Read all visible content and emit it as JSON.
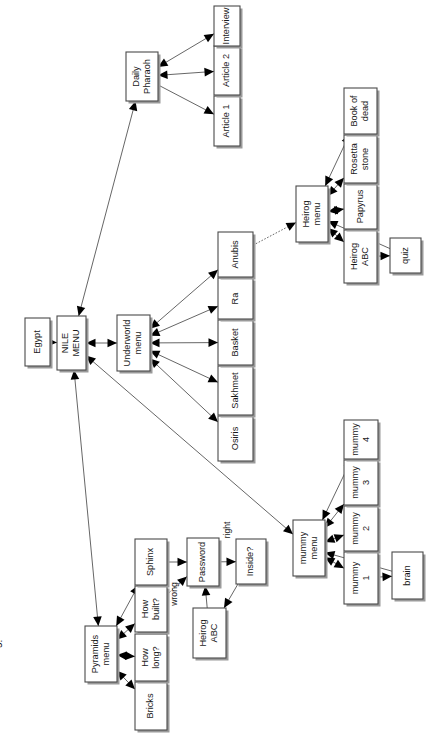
{
  "diagram": {
    "orientation": "rotated-90-counterclockwise",
    "root_label": "Egypt",
    "caption_fragment": "5.",
    "colors": {
      "box_stroke": "#4a4a4a",
      "box_fill": "#ffffff",
      "shadow": "#9a9a9a",
      "edge": "#4a4a4a",
      "arrow": "#000000",
      "text": "#1a1a1a",
      "background": "#ffffff"
    },
    "nodes": [
      {
        "id": "egypt",
        "label": "Egypt",
        "lines": [
          "Egypt"
        ]
      },
      {
        "id": "nile-menu",
        "label": "NILE MENU",
        "lines": [
          "NILE",
          "MENU"
        ]
      },
      {
        "id": "daily-pharaoh",
        "label": "Daily Pharaoh",
        "lines": [
          "Daily",
          "Pharaoh"
        ]
      },
      {
        "id": "article-1",
        "label": "Article 1",
        "lines": [
          "Article 1"
        ]
      },
      {
        "id": "article-2",
        "label": "Article 2",
        "lines": [
          "Article 2"
        ]
      },
      {
        "id": "interview",
        "label": "Interview",
        "lines": [
          "Interview"
        ]
      },
      {
        "id": "underworld-menu",
        "label": "Underworld menu",
        "lines": [
          "Underworld",
          "menu"
        ]
      },
      {
        "id": "osiris",
        "label": "Osiris",
        "lines": [
          "Osiris"
        ]
      },
      {
        "id": "sakhmet",
        "label": "Sakhmet",
        "lines": [
          "Sakhmet"
        ]
      },
      {
        "id": "basket",
        "label": "Basket",
        "lines": [
          "Basket"
        ]
      },
      {
        "id": "ra",
        "label": "Ra",
        "lines": [
          "Ra"
        ]
      },
      {
        "id": "anubis",
        "label": "Anubis",
        "lines": [
          "Anubis"
        ]
      },
      {
        "id": "heirog-menu",
        "label": "Heirog menu",
        "lines": [
          "Heirog",
          "menu"
        ]
      },
      {
        "id": "heirog-abc",
        "label": "Heirog ABC",
        "lines": [
          "Heirog",
          "ABC"
        ]
      },
      {
        "id": "papyrus",
        "label": "Papyrus",
        "lines": [
          "Papyrus"
        ]
      },
      {
        "id": "rosetta-stone",
        "label": "Rosetta stone",
        "lines": [
          "Rosetta",
          "stone"
        ]
      },
      {
        "id": "book-of-dead",
        "label": "Book of dead",
        "lines": [
          "Book of",
          "dead"
        ]
      },
      {
        "id": "quiz",
        "label": "quiz",
        "lines": [
          "quiz"
        ]
      },
      {
        "id": "mummy-menu",
        "label": "mummy menu",
        "lines": [
          "mummy",
          "menu"
        ]
      },
      {
        "id": "mummy-1",
        "label": "mummy 1",
        "lines": [
          "mummy",
          "1"
        ]
      },
      {
        "id": "mummy-2",
        "label": "mummy 2",
        "lines": [
          "mummy",
          "2"
        ]
      },
      {
        "id": "mummy-3",
        "label": "mummy 3",
        "lines": [
          "mummy",
          "3"
        ]
      },
      {
        "id": "mummy-4",
        "label": "mummy 4",
        "lines": [
          "mummy",
          "4"
        ]
      },
      {
        "id": "brain",
        "label": "brain",
        "lines": [
          "brain"
        ]
      },
      {
        "id": "pyramids-menu",
        "label": "Pyramids menu",
        "lines": [
          "Pyramids",
          "menu"
        ]
      },
      {
        "id": "bricks",
        "label": "Bricks",
        "lines": [
          "Bricks"
        ]
      },
      {
        "id": "how-long",
        "label": "How long?",
        "lines": [
          "How",
          "long?"
        ]
      },
      {
        "id": "how-built",
        "label": "How built?",
        "lines": [
          "How",
          "built?"
        ]
      },
      {
        "id": "sphinx",
        "label": "Sphinx",
        "lines": [
          "Sphinx"
        ]
      },
      {
        "id": "password",
        "label": "Password",
        "lines": [
          "Password"
        ]
      },
      {
        "id": "inside",
        "label": "Inside?",
        "lines": [
          "Inside?"
        ]
      },
      {
        "id": "heirog-abc-2",
        "label": "Heirog ABC",
        "lines": [
          "Heirog",
          "ABC"
        ]
      }
    ],
    "edge_labels": [
      {
        "id": "wrong",
        "label": "wrong"
      },
      {
        "id": "right",
        "label": "right"
      }
    ],
    "edges": [
      {
        "from": "egypt",
        "to": "nile-menu",
        "type": "single"
      },
      {
        "from": "nile-menu",
        "to": "daily-pharaoh",
        "type": "double"
      },
      {
        "from": "daily-pharaoh",
        "to": "article-1",
        "type": "single"
      },
      {
        "from": "daily-pharaoh",
        "to": "article-2",
        "type": "double"
      },
      {
        "from": "daily-pharaoh",
        "to": "interview",
        "type": "double"
      },
      {
        "from": "nile-menu",
        "to": "underworld-menu",
        "type": "double"
      },
      {
        "from": "underworld-menu",
        "to": "osiris",
        "type": "double"
      },
      {
        "from": "underworld-menu",
        "to": "sakhmet",
        "type": "double"
      },
      {
        "from": "underworld-menu",
        "to": "basket",
        "type": "double"
      },
      {
        "from": "underworld-menu",
        "to": "ra",
        "type": "double"
      },
      {
        "from": "underworld-menu",
        "to": "anubis",
        "type": "double"
      },
      {
        "from": "anubis",
        "to": "heirog-menu",
        "type": "dotted"
      },
      {
        "from": "heirog-menu",
        "to": "book-of-dead",
        "type": "double"
      },
      {
        "from": "heirog-menu",
        "to": "rosetta-stone",
        "type": "double"
      },
      {
        "from": "heirog-menu",
        "to": "papyrus",
        "type": "double"
      },
      {
        "from": "heirog-menu",
        "to": "heirog-abc",
        "type": "double"
      },
      {
        "from": "heirog-abc",
        "to": "quiz",
        "type": "single"
      },
      {
        "from": "quiz",
        "to": "heirog-menu",
        "type": "single"
      },
      {
        "from": "nile-menu",
        "to": "mummy-menu",
        "type": "double"
      },
      {
        "from": "mummy-menu",
        "to": "mummy-1",
        "type": "double"
      },
      {
        "from": "mummy-menu",
        "to": "mummy-2",
        "type": "double"
      },
      {
        "from": "mummy-menu",
        "to": "mummy-3",
        "type": "double"
      },
      {
        "from": "mummy-menu",
        "to": "mummy-4",
        "type": "double"
      },
      {
        "from": "mummy-1",
        "to": "brain",
        "type": "single"
      },
      {
        "from": "brain",
        "to": "mummy-menu",
        "type": "single"
      },
      {
        "from": "nile-menu",
        "to": "pyramids-menu",
        "type": "double"
      },
      {
        "from": "pyramids-menu",
        "to": "bricks",
        "type": "double"
      },
      {
        "from": "pyramids-menu",
        "to": "how-long",
        "type": "double"
      },
      {
        "from": "pyramids-menu",
        "to": "how-built",
        "type": "double"
      },
      {
        "from": "pyramids-menu",
        "to": "sphinx",
        "type": "double"
      },
      {
        "from": "how-built",
        "to": "password",
        "type": "dotted",
        "label": "wrong"
      },
      {
        "from": "sphinx",
        "to": "password",
        "type": "single"
      },
      {
        "from": "password",
        "to": "inside",
        "type": "single",
        "label": "right"
      },
      {
        "from": "inside",
        "to": "heirog-abc-2",
        "type": "single"
      },
      {
        "from": "heirog-abc-2",
        "to": "password",
        "type": "single"
      }
    ]
  }
}
